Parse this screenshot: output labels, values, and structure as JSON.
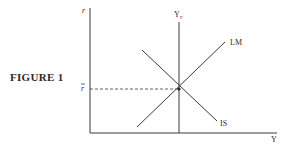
{
  "figure": {
    "title": "FIGURE 1",
    "type": "IS-LM diagram",
    "axes": {
      "y_label": "r",
      "x_label": "Y"
    },
    "curves": [
      {
        "name": "LM",
        "label": "LM",
        "slope": "upward"
      },
      {
        "name": "IS",
        "label": "IS",
        "slope": "downward"
      }
    ],
    "vertical_line": {
      "label": "Y",
      "subscript": "F"
    },
    "equilibrium": {
      "r_label": "r",
      "r_label_bar": true,
      "dashed_guide": true
    },
    "colors": {
      "line": "#3a3a3a",
      "text": "#2a2a2a",
      "background": "#ffffff"
    }
  }
}
